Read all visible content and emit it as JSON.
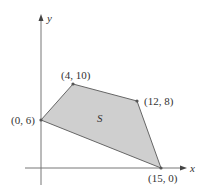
{
  "diagram": {
    "type": "feasible-region",
    "region_label": "S",
    "axes": {
      "x_label": "x",
      "y_label": "y"
    },
    "vertices": [
      {
        "x": 0,
        "y": 6,
        "label": "(0, 6)"
      },
      {
        "x": 4,
        "y": 10,
        "label": "(4, 10)"
      },
      {
        "x": 12,
        "y": 8,
        "label": "(12, 8)"
      },
      {
        "x": 15,
        "y": 0,
        "label": "(15, 0)"
      }
    ],
    "colors": {
      "fill": "#cfcfcf",
      "edge": "#666666",
      "axis": "#777777",
      "text": "#333333"
    }
  }
}
